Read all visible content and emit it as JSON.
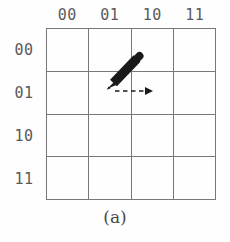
{
  "figure": {
    "caption": "(a)",
    "grid": {
      "rows": 4,
      "cols": 4,
      "line_color": "#787878",
      "background": "#fefefe"
    },
    "column_headers": [
      "00",
      "01",
      "10",
      "11"
    ],
    "row_headers": [
      "00",
      "01",
      "10",
      "11"
    ],
    "label_color": "#5a5a5a",
    "annotation": {
      "pen_icon": "pen-stylus-icon",
      "pen_color": "#1a1a1a",
      "pen_cell_row": "01",
      "pen_cell_col": "01",
      "arrow_icon": "dashed-arrow-right-icon",
      "arrow_color": "#1a1a1a",
      "arrow_direction": "right"
    }
  }
}
